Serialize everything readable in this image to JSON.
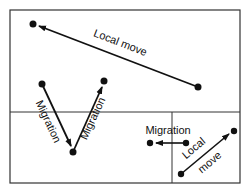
{
  "labels": {
    "local_move_top": "Local move",
    "migration_left": "Migration",
    "migration_right": "Migration",
    "migration_small": "Migration",
    "local_move_small_1": "Local",
    "local_move_small_2": "move"
  },
  "colors": {
    "line": "#111111",
    "frame": "#333333",
    "background": "#ffffff"
  }
}
